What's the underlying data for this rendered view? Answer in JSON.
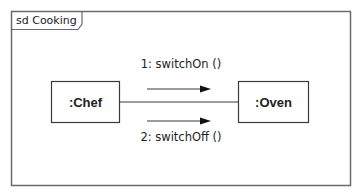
{
  "diagram": {
    "frame_label": "sd Cooking",
    "objects": [
      {
        "id": "chef",
        "label": ":Chef"
      },
      {
        "id": "oven",
        "label": ":Oven"
      }
    ],
    "link": {
      "from": "chef",
      "to": "oven"
    },
    "messages": [
      {
        "label": "1: switchOn ()",
        "direction": "chef-to-oven"
      },
      {
        "label": "2: switchOff ()",
        "direction": "chef-to-oven"
      }
    ],
    "colors": {
      "line": "#3a3a3a",
      "frame": "#666666",
      "text": "#222222"
    }
  }
}
